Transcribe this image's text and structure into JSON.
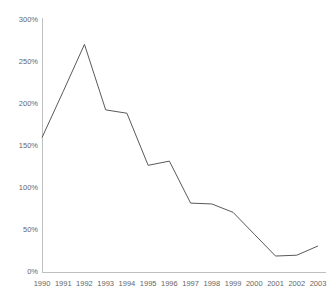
{
  "chart_data": {
    "type": "line",
    "title": "",
    "subtitle": "",
    "xlabel": "",
    "ylabel": "",
    "categories": [
      "1990",
      "1991",
      "1992",
      "1993",
      "1994",
      "1995",
      "1996",
      "1997",
      "1998",
      "1999",
      "2000",
      "2001",
      "2002",
      "2003"
    ],
    "x": [
      1990,
      1991,
      1992,
      1993,
      1994,
      1995,
      1996,
      1997,
      1998,
      1999,
      2000,
      2001,
      2002,
      2003
    ],
    "values": [
      160,
      215,
      271,
      193,
      189,
      127,
      132,
      82,
      81,
      71,
      45,
      19,
      20,
      31
    ],
    "series": [
      {
        "name": "",
        "values": [
          160,
          215,
          271,
          193,
          189,
          127,
          132,
          82,
          81,
          71,
          45,
          19,
          20,
          31
        ]
      }
    ],
    "ylim": [
      0,
      300
    ],
    "yticks": [
      0,
      50,
      100,
      150,
      200,
      250,
      300
    ],
    "ytick_labels": [
      "0%",
      "50%",
      "100%",
      "150%",
      "200%",
      "250%",
      "300%"
    ],
    "xtick_labels": [
      "1990",
      "1991",
      "1992",
      "1993",
      "1994",
      "1995",
      "1996",
      "1997",
      "1998",
      "1999",
      "2000",
      "2001",
      "2002",
      "2003"
    ],
    "grid": false,
    "legend": false,
    "legend_position": "none",
    "annotations": [],
    "colors": {
      "line": "#595959",
      "axis": "#bfbfbf",
      "tick_text": "#666666",
      "background": "#ffffff"
    }
  }
}
